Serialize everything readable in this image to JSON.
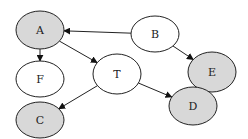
{
  "diagram": {
    "type": "directed-graph",
    "nodes": [
      {
        "id": "A",
        "label": "A",
        "shaded": true,
        "cx": 40,
        "cy": 30,
        "rx": 24,
        "ry": 19
      },
      {
        "id": "B",
        "label": "B",
        "shaded": false,
        "cx": 155,
        "cy": 34,
        "rx": 24,
        "ry": 18
      },
      {
        "id": "E",
        "label": "E",
        "shaded": true,
        "cx": 212,
        "cy": 72,
        "rx": 24,
        "ry": 20
      },
      {
        "id": "F",
        "label": "F",
        "shaded": false,
        "cx": 40,
        "cy": 79,
        "rx": 24,
        "ry": 18
      },
      {
        "id": "T",
        "label": "T",
        "shaded": false,
        "cx": 117,
        "cy": 74,
        "rx": 24,
        "ry": 20
      },
      {
        "id": "C",
        "label": "C",
        "shaded": true,
        "cx": 40,
        "cy": 120,
        "rx": 24,
        "ry": 18
      },
      {
        "id": "D",
        "label": "D",
        "shaded": true,
        "cx": 193,
        "cy": 106,
        "rx": 24,
        "ry": 19
      }
    ],
    "edges": [
      {
        "from": "B",
        "to": "A"
      },
      {
        "from": "A",
        "to": "F"
      },
      {
        "from": "A",
        "to": "T"
      },
      {
        "from": "B",
        "to": "E"
      },
      {
        "from": "E",
        "to": "D"
      },
      {
        "from": "T",
        "to": "C"
      },
      {
        "from": "T",
        "to": "D"
      }
    ],
    "colors": {
      "shaded": "#d8d8d8",
      "unshaded": "#ffffff",
      "stroke": "#222222"
    }
  }
}
